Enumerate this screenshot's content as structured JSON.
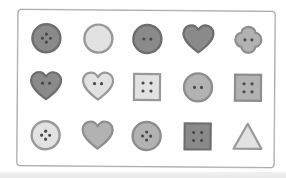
{
  "worksheet": {
    "rows": 3,
    "columns": 5,
    "colors": {
      "dark_fill": "#8a8a8a",
      "dark_stroke": "#6e6e6e",
      "mid_fill": "#b2b2b2",
      "mid_stroke": "#8e8e8e",
      "light_fill": "#e2e2e2",
      "light_stroke": "#999999",
      "hole": "#4a4a4a",
      "frame": "#a9a9a9"
    },
    "items": [
      {
        "shape": "circle",
        "tone": "dark",
        "holes": 4,
        "row": 0,
        "col": 0
      },
      {
        "shape": "circle",
        "tone": "light",
        "holes": 0,
        "row": 0,
        "col": 1
      },
      {
        "shape": "circle",
        "tone": "dark",
        "holes": 2,
        "row": 0,
        "col": 2
      },
      {
        "shape": "heart",
        "tone": "dark",
        "holes": 0,
        "row": 0,
        "col": 3
      },
      {
        "shape": "flower",
        "tone": "mid",
        "holes": 2,
        "row": 0,
        "col": 4
      },
      {
        "shape": "heart",
        "tone": "dark",
        "holes": 2,
        "row": 1,
        "col": 0
      },
      {
        "shape": "heart",
        "tone": "light",
        "holes": 2,
        "row": 1,
        "col": 1
      },
      {
        "shape": "square",
        "tone": "light",
        "holes": 4,
        "row": 1,
        "col": 2
      },
      {
        "shape": "circle",
        "tone": "mid",
        "holes": 2,
        "row": 1,
        "col": 3
      },
      {
        "shape": "square",
        "tone": "mid",
        "holes": 4,
        "row": 1,
        "col": 4
      },
      {
        "shape": "circle",
        "tone": "light",
        "holes": 4,
        "row": 2,
        "col": 0
      },
      {
        "shape": "heart",
        "tone": "mid",
        "holes": 0,
        "row": 2,
        "col": 1
      },
      {
        "shape": "circle",
        "tone": "mid",
        "holes": 4,
        "row": 2,
        "col": 2
      },
      {
        "shape": "square",
        "tone": "dark",
        "holes": 4,
        "row": 2,
        "col": 3
      },
      {
        "shape": "triangle",
        "tone": "light",
        "holes": 0,
        "row": 2,
        "col": 4
      }
    ]
  }
}
